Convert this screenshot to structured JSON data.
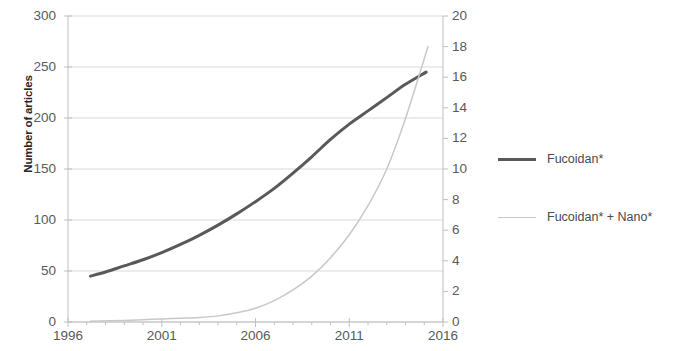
{
  "chart_data": {
    "type": "line",
    "title": "",
    "xlabel": "",
    "ylabel": "Number of articles",
    "ylabel_right": "",
    "xlim": [
      1996,
      2016
    ],
    "ylim": [
      0,
      300
    ],
    "ylim_right": [
      0,
      20
    ],
    "grid": true,
    "legend_position": "right",
    "x_ticks": [
      "1996",
      "2001",
      "2006",
      "2011",
      "2016"
    ],
    "x_tick_values": [
      1996,
      2001,
      2006,
      2011,
      2016
    ],
    "y_ticks_left": [
      "0",
      "50",
      "100",
      "150",
      "200",
      "250",
      "300"
    ],
    "y_tick_values_left": [
      0,
      50,
      100,
      150,
      200,
      250,
      300
    ],
    "y_ticks_right": [
      "0",
      "2",
      "4",
      "6",
      "8",
      "10",
      "12",
      "14",
      "16",
      "18",
      "20"
    ],
    "y_tick_values_right": [
      0,
      2,
      4,
      6,
      8,
      10,
      12,
      14,
      16,
      18,
      20
    ],
    "series": [
      {
        "name": "Fucoidan*",
        "axis": "left",
        "color": "#595959",
        "width": 3,
        "x": [
          1997.2,
          1998,
          1999,
          2000,
          2001,
          2002,
          2003,
          2004,
          2005,
          2006,
          2007,
          2008,
          2009,
          2010,
          2011,
          2012,
          2013,
          2014,
          2015.1
        ],
        "values": [
          45,
          49,
          55,
          61,
          68,
          76,
          85,
          95,
          106,
          118,
          131,
          146,
          162,
          179,
          194,
          207,
          220,
          233,
          245
        ]
      },
      {
        "name": "Fucoidan* + Nano*",
        "axis": "right",
        "color": "#c8c8c8",
        "width": 1.5,
        "x": [
          1997.2,
          1999,
          2000,
          2001,
          2002,
          2003,
          2004,
          2005,
          2006,
          2007,
          2008,
          2009,
          2010,
          2011,
          2012,
          2013,
          2014,
          2015.2
        ],
        "values": [
          0.05,
          0.1,
          0.15,
          0.2,
          0.25,
          0.3,
          0.4,
          0.6,
          0.9,
          1.4,
          2.1,
          3.0,
          4.2,
          5.7,
          7.6,
          10.0,
          13.3,
          18.0
        ]
      }
    ]
  },
  "legend": {
    "items": [
      {
        "label": "Fucoidan*"
      },
      {
        "label": "Fucoidan* + Nano*"
      }
    ]
  },
  "colors": {
    "series_primary": "#595959",
    "series_secondary": "#c8c8c8",
    "grid": "#d9d9d9",
    "axis": "#bfbfbf",
    "text": "#5a5a5a"
  }
}
